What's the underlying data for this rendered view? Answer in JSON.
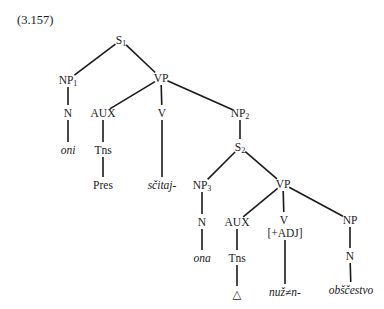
{
  "example_number": "(3.157)",
  "nodes": {
    "S1": {
      "label": "S",
      "sub": "1",
      "x": 121,
      "y": 40
    },
    "NP1": {
      "label": "NP",
      "sub": "1",
      "x": 68,
      "y": 80
    },
    "VP1": {
      "label": "VP",
      "sub": "",
      "x": 161,
      "y": 78
    },
    "N1": {
      "label": "N",
      "sub": "",
      "x": 68,
      "y": 113
    },
    "oni": {
      "label": "oni",
      "sub": "",
      "x": 68,
      "y": 150
    },
    "AUX1": {
      "label": "AUX",
      "sub": "",
      "x": 103,
      "y": 113
    },
    "Tns1": {
      "label": "Tns",
      "sub": "",
      "x": 103,
      "y": 150
    },
    "Pres": {
      "label": "Pres",
      "sub": "",
      "x": 103,
      "y": 185
    },
    "V1": {
      "label": "V",
      "sub": "",
      "x": 162,
      "y": 113
    },
    "scitaj": {
      "label": "sčitaj-",
      "sub": "",
      "x": 162,
      "y": 185
    },
    "NP2": {
      "label": "NP",
      "sub": "2",
      "x": 240,
      "y": 113
    },
    "S2": {
      "label": "S",
      "sub": "2",
      "x": 240,
      "y": 147
    },
    "NP3": {
      "label": "NP",
      "sub": "3",
      "x": 202,
      "y": 185
    },
    "N2": {
      "label": "N",
      "sub": "",
      "x": 202,
      "y": 222
    },
    "ona": {
      "label": "ona",
      "sub": "",
      "x": 202,
      "y": 258
    },
    "VP2": {
      "label": "VP",
      "sub": "",
      "x": 283,
      "y": 184
    },
    "AUX2": {
      "label": "AUX",
      "sub": "",
      "x": 237,
      "y": 222
    },
    "Tns2": {
      "label": "Tns",
      "sub": "",
      "x": 237,
      "y": 258
    },
    "delta": {
      "label": "△",
      "sub": "",
      "x": 237,
      "y": 294
    },
    "V2": {
      "label": "V",
      "sub": "",
      "x": 284,
      "y": 220
    },
    "ADJ": {
      "label": "[+ADJ]",
      "sub": "",
      "x": 285,
      "y": 233
    },
    "nuzn": {
      "label": "nuž≠n-",
      "sub": "",
      "x": 285,
      "y": 292
    },
    "NP4": {
      "label": "NP",
      "sub": "",
      "x": 350,
      "y": 220
    },
    "N3": {
      "label": "N",
      "sub": "",
      "x": 350,
      "y": 256
    },
    "obscestvo": {
      "label": "obščestvo",
      "sub": "",
      "x": 351,
      "y": 290
    }
  },
  "italic_nodes": [
    "oni",
    "scitaj",
    "ona",
    "nuzn",
    "obscestvo"
  ],
  "edges": [
    [
      "S1",
      "NP1"
    ],
    [
      "S1",
      "VP1"
    ],
    [
      "NP1",
      "N1"
    ],
    [
      "N1",
      "oni"
    ],
    [
      "VP1",
      "AUX1"
    ],
    [
      "VP1",
      "V1"
    ],
    [
      "VP1",
      "NP2"
    ],
    [
      "AUX1",
      "Tns1"
    ],
    [
      "Tns1",
      "Pres"
    ],
    [
      "V1",
      "scitaj"
    ],
    [
      "NP2",
      "S2"
    ],
    [
      "S2",
      "NP3"
    ],
    [
      "S2",
      "VP2"
    ],
    [
      "NP3",
      "N2"
    ],
    [
      "N2",
      "ona"
    ],
    [
      "VP2",
      "AUX2"
    ],
    [
      "VP2",
      "V2"
    ],
    [
      "VP2",
      "NP4"
    ],
    [
      "AUX2",
      "Tns2"
    ],
    [
      "Tns2",
      "delta"
    ],
    [
      "ADJ",
      "nuzn"
    ],
    [
      "NP4",
      "N3"
    ],
    [
      "N3",
      "obscestvo"
    ]
  ]
}
